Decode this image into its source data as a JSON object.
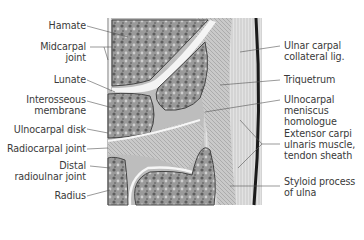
{
  "figure": {
    "type": "anatomical cross-section illustration"
  },
  "labels_left": [
    {
      "text": "Hamate",
      "y": 20
    },
    {
      "text": "Midcarpal\njoint",
      "y": 41
    },
    {
      "text": "Lunate",
      "y": 74
    },
    {
      "text": "Interosseous\nmembrane",
      "y": 94
    },
    {
      "text": "Ulnocarpal disk",
      "y": 124
    },
    {
      "text": "Radiocarpal joint",
      "y": 143
    },
    {
      "text": "Distal\nradioulnar joint",
      "y": 160
    },
    {
      "text": "Radius",
      "y": 190
    }
  ],
  "labels_right": [
    {
      "text": "Ulnar carpal\ncollateral lig.",
      "y": 40
    },
    {
      "text": "Triquetrum",
      "y": 74
    },
    {
      "text": "Ulnocarpal\nmeniscus\nhomologue",
      "y": 94
    },
    {
      "text": "Extensor carpi\nulnaris muscle,\ntendon sheath",
      "y": 140
    },
    {
      "text": "Styloid process\nof ulna",
      "y": 181
    }
  ],
  "colors": {
    "label_text": "#3a3a3a",
    "leader_line": "#555555",
    "bone_fill": "#8a8a8a",
    "joint_space": "#f2f2f2",
    "ligament": "#b8b8b8"
  }
}
